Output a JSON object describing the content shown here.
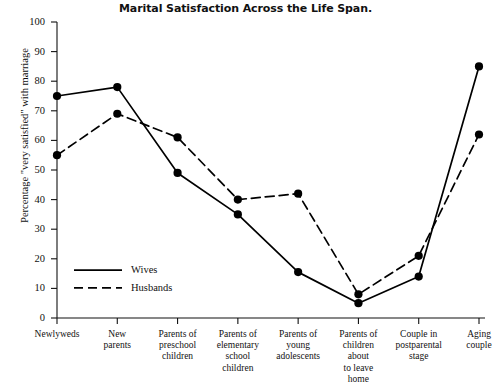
{
  "chart_data": {
    "type": "line",
    "title": "Marital Satisfaction Across the Life Span.",
    "xlabel": "",
    "ylabel": "Percentage \"very satisfied\" with marriage",
    "ylim": [
      0,
      100
    ],
    "ytick_step": 10,
    "yticks": [
      0,
      10,
      20,
      30,
      40,
      50,
      60,
      70,
      80,
      90,
      100
    ],
    "grid": false,
    "legend_position": "inside lower-left",
    "categories": [
      "Newlyweds",
      "New parents",
      "Parents of preschool children",
      "Parents of elementary school children",
      "Parents of young adolescents",
      "Parents of children about to leave home",
      "Couple in postparental stage",
      "Aging couple"
    ],
    "category_lines": [
      [
        "Newlyweds"
      ],
      [
        "New",
        "parents"
      ],
      [
        "Parents of",
        "preschool",
        "children"
      ],
      [
        "Parents of",
        "elementary",
        "school",
        "children"
      ],
      [
        "Parents of",
        "young",
        "adolescents"
      ],
      [
        "Parents of",
        "children",
        "about",
        "to leave",
        "home"
      ],
      [
        "Couple in",
        "postparental",
        "stage"
      ],
      [
        "Aging",
        "couple"
      ]
    ],
    "series": [
      {
        "name": "Wives",
        "style": "solid",
        "color": "#000000",
        "values": [
          75,
          78,
          49,
          35,
          15.5,
          5,
          14,
          85
        ]
      },
      {
        "name": "Husbands",
        "style": "dashed",
        "color": "#000000",
        "values": [
          55,
          69,
          61,
          40,
          42,
          8,
          21,
          62
        ]
      }
    ]
  },
  "legend": {
    "items": [
      {
        "label": "Wives",
        "style": "solid"
      },
      {
        "label": "Husbands",
        "style": "dashed"
      }
    ]
  }
}
